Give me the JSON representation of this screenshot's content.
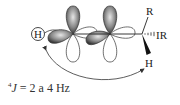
{
  "diagram": {
    "type": "orbital-coupling",
    "labels": {
      "h_left": "H",
      "r_top": "R",
      "r_right": "IR",
      "h_bottom": "H"
    },
    "caption": {
      "superscript": "4",
      "symbol": "J",
      "text": " = 2 a 4 Hz"
    },
    "colors": {
      "lobe_shaded": "#8a8a8a",
      "lobe_dark": "#3a3a3a",
      "line": "#222222"
    }
  }
}
